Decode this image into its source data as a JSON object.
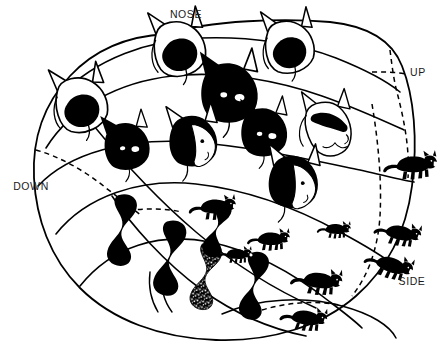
{
  "figure": {
    "background_color": "#ffffff",
    "ink_color": "#000000",
    "width": 447,
    "height": 358
  },
  "labels": [
    {
      "id": "nose",
      "text": "NOSE",
      "x": 186,
      "y": 18,
      "anchor": "middle"
    },
    {
      "id": "up",
      "text": "UP",
      "x": 418,
      "y": 76,
      "anchor": "middle"
    },
    {
      "id": "down",
      "text": "DOWN",
      "x": 31,
      "y": 190,
      "anchor": "middle"
    },
    {
      "id": "side",
      "text": "SIDE",
      "x": 412,
      "y": 285,
      "anchor": "middle"
    }
  ],
  "outline": {
    "name": "map-boundary",
    "description": "closed kidney/oval shaped cortical region boundary"
  },
  "contours": [
    {
      "id": "contour-1",
      "style": "solid"
    },
    {
      "id": "contour-2",
      "style": "solid"
    },
    {
      "id": "contour-3",
      "style": "solid"
    },
    {
      "id": "contour-4",
      "style": "solid"
    },
    {
      "id": "contour-5",
      "style": "solid"
    },
    {
      "id": "contour-6",
      "style": "solid"
    },
    {
      "id": "contour-down-dashed",
      "style": "dashed"
    },
    {
      "id": "contour-up-dashed",
      "style": "dashed"
    },
    {
      "id": "contour-side-dashed",
      "style": "dashed"
    },
    {
      "id": "contour-bottom-dashed",
      "style": "dashed"
    }
  ],
  "cat_figures": [
    {
      "id": "head-1",
      "kind": "head",
      "x": 178,
      "y": 52,
      "scale": 1.0,
      "rotate": -6,
      "face": "front",
      "mask": "dark-muzzle"
    },
    {
      "id": "head-2",
      "kind": "head",
      "x": 285,
      "y": 50,
      "scale": 0.95,
      "rotate": -4,
      "face": "front",
      "mask": "dark-muzzle"
    },
    {
      "id": "head-3",
      "kind": "head",
      "x": 228,
      "y": 93,
      "scale": 1.05,
      "rotate": 2,
      "face": "front",
      "mask": "mostly-dark"
    },
    {
      "id": "head-4",
      "kind": "head",
      "x": 78,
      "y": 106,
      "scale": 1.0,
      "rotate": -8,
      "face": "front",
      "mask": "dark-muzzle"
    },
    {
      "id": "head-5",
      "kind": "head",
      "x": 123,
      "y": 146,
      "scale": 0.85,
      "rotate": -4,
      "face": "front",
      "mask": "dark-lower"
    },
    {
      "id": "head-6",
      "kind": "head",
      "x": 192,
      "y": 141,
      "scale": 0.92,
      "rotate": 0,
      "face": "three-quarter",
      "mask": "dark-body-white-face"
    },
    {
      "id": "head-7",
      "kind": "head",
      "x": 262,
      "y": 132,
      "scale": 0.85,
      "rotate": 2,
      "face": "three-quarter",
      "mask": "mostly-dark"
    },
    {
      "id": "head-8",
      "kind": "head",
      "x": 325,
      "y": 126,
      "scale": 0.9,
      "rotate": 4,
      "face": "profile",
      "mask": "dark-mask-white-muzzle"
    },
    {
      "id": "head-9",
      "kind": "head",
      "x": 291,
      "y": 182,
      "scale": 0.95,
      "rotate": 6,
      "face": "profile",
      "mask": "dark-body-white-face"
    },
    {
      "id": "body-1",
      "kind": "stretched",
      "x": 124,
      "y": 224,
      "scale": 1.0,
      "rotate": 8,
      "pattern": "solid"
    },
    {
      "id": "body-2",
      "kind": "stretched",
      "x": 170,
      "y": 252,
      "scale": 1.05,
      "rotate": 10,
      "pattern": "solid"
    },
    {
      "id": "body-3",
      "kind": "stretched",
      "x": 206,
      "y": 270,
      "scale": 0.95,
      "rotate": 12,
      "pattern": "mottled"
    },
    {
      "id": "body-4",
      "kind": "stretched",
      "x": 254,
      "y": 280,
      "scale": 0.95,
      "rotate": 10,
      "pattern": "solid"
    },
    {
      "id": "body-5",
      "kind": "stretched",
      "x": 218,
      "y": 224,
      "scale": 0.8,
      "rotate": 16,
      "pattern": "solid"
    },
    {
      "id": "cat-small-1",
      "kind": "full-body",
      "x": 212,
      "y": 206,
      "scale": 0.42,
      "rotate": -4
    },
    {
      "id": "cat-small-2",
      "kind": "full-body",
      "x": 268,
      "y": 238,
      "scale": 0.38,
      "rotate": -2
    },
    {
      "id": "cat-small-3",
      "kind": "full-body",
      "x": 234,
      "y": 253,
      "scale": 0.3,
      "rotate": 0
    },
    {
      "id": "cat-small-4",
      "kind": "full-body",
      "x": 333,
      "y": 228,
      "scale": 0.3,
      "rotate": 0
    },
    {
      "id": "cat-small-5",
      "kind": "full-body",
      "x": 318,
      "y": 280,
      "scale": 0.46,
      "rotate": 4
    },
    {
      "id": "cat-small-6",
      "kind": "full-body",
      "x": 303,
      "y": 317,
      "scale": 0.42,
      "rotate": 6
    },
    {
      "id": "cat-small-7",
      "kind": "full-body",
      "x": 389,
      "y": 265,
      "scale": 0.44,
      "rotate": 16
    },
    {
      "id": "cat-small-8",
      "kind": "full-body",
      "x": 398,
      "y": 232,
      "scale": 0.42,
      "rotate": 10
    },
    {
      "id": "cat-small-9",
      "kind": "full-body",
      "x": 411,
      "y": 165,
      "scale": 0.48,
      "rotate": -4
    }
  ]
}
